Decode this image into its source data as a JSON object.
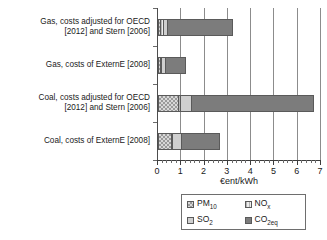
{
  "chart_data": {
    "type": "bar",
    "orientation": "horizontal",
    "stacked": true,
    "title": "",
    "xlabel": "€ent/kWh",
    "ylabel": "",
    "xlim": [
      0,
      7
    ],
    "xticks": [
      0,
      1,
      2,
      3,
      4,
      5,
      6,
      7
    ],
    "xtick_labels": [
      "0",
      "1",
      "2",
      "3",
      "4",
      "5",
      "6",
      "7"
    ],
    "minor_tick_interval": 0.2,
    "grid": "vertical",
    "legend_position": "below-axis",
    "categories": [
      "Gas, costs adjusted for OECD [2012] and Stern [2006]",
      "Gas, costs of ExternE [2008]",
      "Coal, costs adjusted for OECD [2012] and Stern [2006]",
      "Coal, costs of ExternE [2008]"
    ],
    "category_lines": [
      [
        "Gas, costs adjusted for OECD",
        "[2012] and Stern [2006]"
      ],
      [
        "Gas, costs of ExternE [2008]"
      ],
      [
        "Coal, costs adjusted for OECD",
        "[2012] and Stern [2006]"
      ],
      [
        "Coal, costs of ExternE [2008]"
      ]
    ],
    "series": [
      {
        "name": "PM10",
        "key": "pm10",
        "values": [
          0.1,
          0.08,
          0.85,
          0.55
        ]
      },
      {
        "name": "NOx",
        "key": "nox",
        "values": [
          0.1,
          0.07,
          0.1,
          0.05
        ]
      },
      {
        "name": "SO2",
        "key": "so2",
        "values": [
          0.2,
          0.15,
          0.45,
          0.4
        ]
      },
      {
        "name": "CO2eq",
        "key": "co2eq",
        "values": [
          2.8,
          0.9,
          5.3,
          1.65
        ]
      }
    ],
    "totals": [
      3.2,
      1.2,
      6.7,
      2.65
    ]
  },
  "legend": {
    "entries": [
      {
        "label": "PM10",
        "base": "PM",
        "sub": "10",
        "key": "pm10"
      },
      {
        "label": "NOx",
        "base": "NO",
        "sub": "x",
        "key": "nox"
      },
      {
        "label": "SO2",
        "base": "SO",
        "sub": "2",
        "key": "so2"
      },
      {
        "label": "CO2eq",
        "base": "CO",
        "sub": "2eq",
        "key": "co2eq"
      }
    ]
  },
  "colors": {
    "pm10": "#d8d8d8",
    "nox": "#ededed",
    "so2": "#cfcfcf",
    "co2eq": "#7c7c7c",
    "axis": "#3d3d3d",
    "grid": "#8c8c8c",
    "text": "#1a1a1a"
  }
}
